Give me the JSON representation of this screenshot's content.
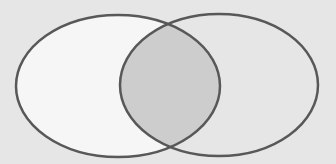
{
  "diagram": {
    "type": "venn",
    "sets": [
      {
        "name": "left-set",
        "cx": 118,
        "cy": 86,
        "rx": 102,
        "ry": 71,
        "fill": "#f6f6f6"
      },
      {
        "name": "right-set",
        "cx": 219,
        "cy": 85,
        "rx": 99,
        "ry": 71,
        "fill": "#e4e4e4"
      }
    ],
    "intersection_fill": "#cdcdcd",
    "stroke": "#585858",
    "background": "#e6e6e6"
  }
}
